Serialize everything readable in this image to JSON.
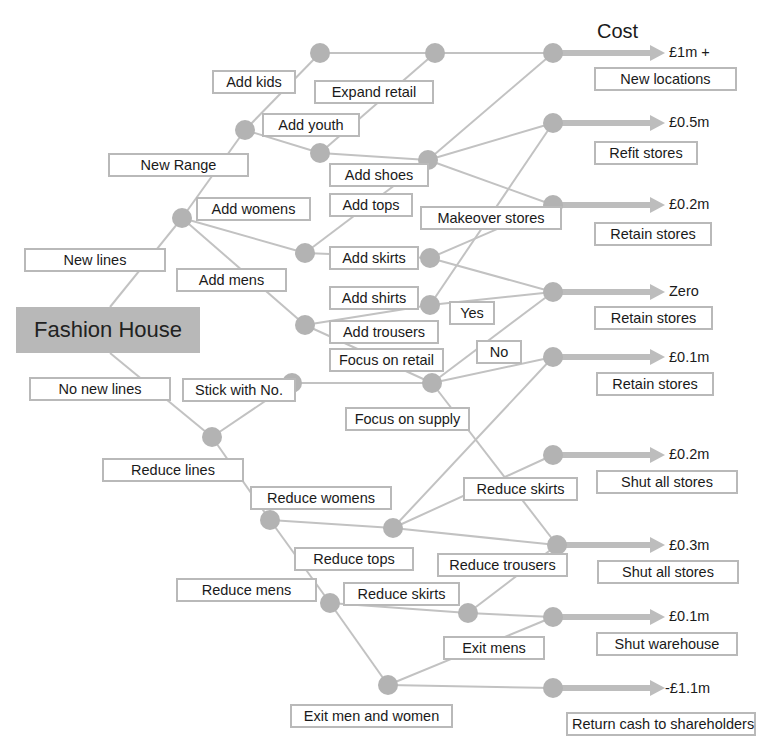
{
  "title": "Cost",
  "root": {
    "label": "Fashion House"
  },
  "colors": {
    "node": "#b3b3b3",
    "edge": "#c2c2c2",
    "arrow": "#bdbdbd",
    "label_border": "#b9b9b9",
    "root_fill": "#b8b8b8"
  },
  "branch_labels": {
    "new_lines": "New lines",
    "no_new_lines": "No new lines",
    "new_range": "New Range",
    "add_kids": "Add kids",
    "add_youth": "Add youth",
    "expand_retail": "Expand retail",
    "add_womens": "Add womens",
    "add_mens": "Add mens",
    "add_shoes": "Add shoes",
    "add_tops": "Add tops",
    "add_skirts": "Add skirts",
    "add_shirts": "Add shirts",
    "add_trousers": "Add trousers",
    "makeover_stores": "Makeover stores",
    "yes": "Yes",
    "no": "No",
    "focus_on_retail": "Focus on retail",
    "focus_on_supply": "Focus on supply",
    "stick_with_no": "Stick with No.",
    "reduce_lines": "Reduce lines",
    "reduce_womens": "Reduce womens",
    "reduce_tops": "Reduce tops",
    "reduce_skirts_upper": "Reduce skirts",
    "reduce_trousers": "Reduce trousers",
    "reduce_mens": "Reduce mens",
    "reduce_skirts_lower": "Reduce skirts",
    "exit_mens": "Exit mens",
    "exit_men_and_women": "Exit men and women"
  },
  "outcomes": [
    {
      "cost": "£1m +",
      "action": "New locations"
    },
    {
      "cost": "£0.5m",
      "action": "Refit stores"
    },
    {
      "cost": "£0.2m",
      "action": "Retain stores"
    },
    {
      "cost": "Zero",
      "action": "Retain stores"
    },
    {
      "cost": "£0.1m",
      "action": "Retain stores"
    },
    {
      "cost": "£0.2m",
      "action": "Shut all stores"
    },
    {
      "cost": "£0.3m",
      "action": "Shut all stores"
    },
    {
      "cost": "£0.1m",
      "action": "Shut warehouse"
    },
    {
      "cost": "-£1.1m",
      "action": "Return cash to shareholders"
    }
  ]
}
